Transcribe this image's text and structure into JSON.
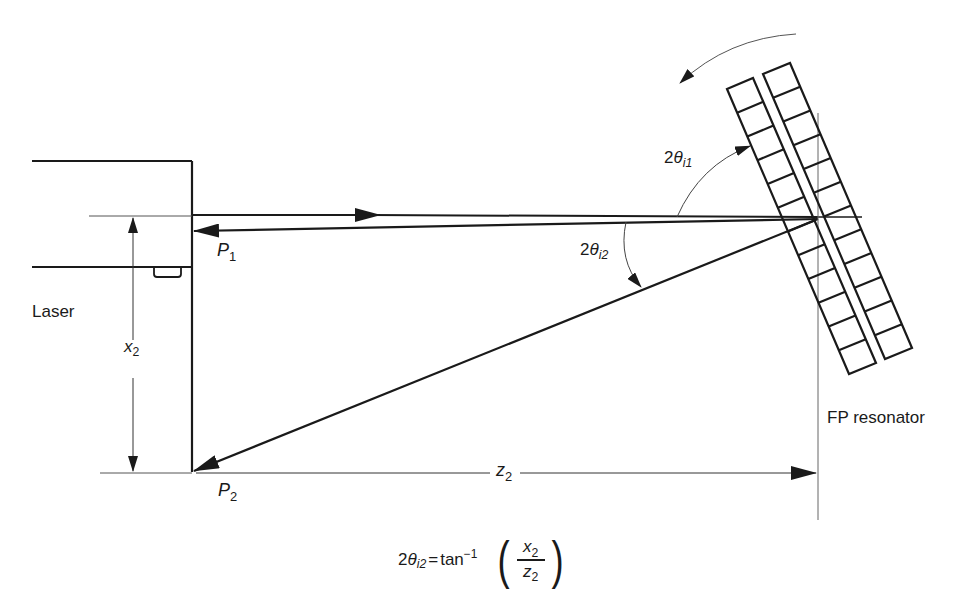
{
  "diagram": {
    "type": "optical-setup"
  },
  "labels": {
    "laser": "Laser",
    "p1": {
      "base": "P",
      "sub": "1"
    },
    "p2": {
      "base": "P",
      "sub": "2"
    },
    "x2": {
      "base": "x",
      "sub": "2"
    },
    "z2": {
      "base": "z",
      "sub": "2"
    },
    "angle_i1": {
      "prefix": "2",
      "symbol": "θ",
      "sub": "i1"
    },
    "angle_i2": {
      "prefix": "2",
      "symbol": "θ",
      "sub": "i2"
    },
    "fp_resonator": "FP resonator"
  },
  "formula": {
    "lhs_prefix": "2",
    "lhs_symbol": "θ",
    "lhs_sub": "i2",
    "equals": "=",
    "func": "tan",
    "func_sup": "−1",
    "open_paren": "(",
    "numerator": {
      "base": "x",
      "sub": "2"
    },
    "denominator": {
      "base": "z",
      "sub": "2"
    },
    "close_paren": ")"
  },
  "resonator": {
    "plates": 2,
    "cells_per_plate": 12
  },
  "colors": {
    "line": "#1a1a1a",
    "thin_line": "#555555",
    "background": "#ffffff"
  }
}
